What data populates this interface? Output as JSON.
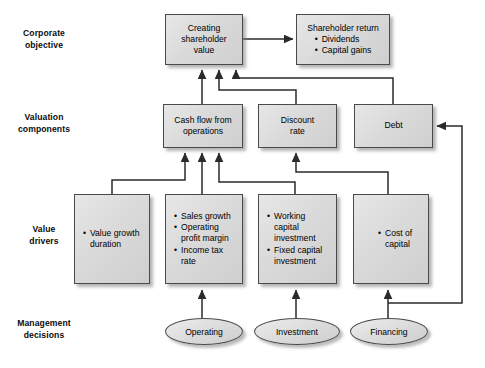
{
  "diagram": {
    "colors": {
      "node_fill": "#dcdcdc",
      "node_border": "#4a4a4a",
      "connector": "#2b2b2b",
      "background": "#ffffff",
      "text": "#000000"
    },
    "row_labels": [
      {
        "id": "corporate-objective",
        "text": "Corporate\nobjective"
      },
      {
        "id": "valuation-components",
        "text": "Valuation\ncomponents"
      },
      {
        "id": "value-drivers",
        "text": "Value\ndrivers"
      },
      {
        "id": "management-decisions",
        "text": "Management\ndecisions"
      }
    ],
    "nodes": {
      "creating_shareholder_value": {
        "lines": [
          "Creating",
          "shareholder",
          "value"
        ]
      },
      "shareholder_return": {
        "heading": "Shareholder return",
        "bullets": [
          "Dividends",
          "Capital gains"
        ]
      },
      "cash_flow_from_operations": {
        "lines": [
          "Cash flow from",
          "operations"
        ]
      },
      "discount_rate": {
        "lines": [
          "Discount",
          "rate"
        ]
      },
      "debt": {
        "lines": [
          "Debt"
        ]
      },
      "value_growth_duration": {
        "bullets": [
          "Value growth duration"
        ]
      },
      "operating_drivers": {
        "bullets": [
          "Sales growth",
          "Operating profit margin",
          "Income tax rate"
        ]
      },
      "investment_drivers": {
        "bullets": [
          "Working capital investment",
          "Fixed capital investment"
        ]
      },
      "cost_of_capital": {
        "bullets": [
          "Cost of capital"
        ]
      },
      "operating_decision": {
        "label": "Operating"
      },
      "investment_decision": {
        "label": "Investment"
      },
      "financing_decision": {
        "label": "Financing"
      }
    }
  }
}
